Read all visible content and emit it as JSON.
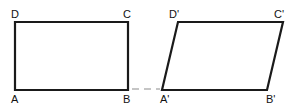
{
  "figure": {
    "background_color": "#ffffff",
    "stroke_color": "#1a1a1a",
    "stroke_width": 2.2,
    "connector_color": "#b3b3b3",
    "shapes": [
      {
        "id": "rectangle-abcd",
        "name": "rectangle-abcd",
        "kind": "rectangle",
        "points": "15,22 128,22 128,90 15,90",
        "vertices": [
          {
            "key": "A",
            "label": "A",
            "x": 15,
            "y": 90
          },
          {
            "key": "B",
            "label": "B",
            "x": 128,
            "y": 90
          },
          {
            "key": "C",
            "label": "C",
            "x": 128,
            "y": 22
          },
          {
            "key": "D",
            "label": "D",
            "x": 15,
            "y": 22
          }
        ]
      },
      {
        "id": "parallelogram-abcd-prime",
        "name": "parallelogram-abcd-prime",
        "kind": "parallelogram",
        "points": "178,22 283,22 267,90 162,90",
        "shear_offset_px": 16,
        "vertices": [
          {
            "key": "Ap",
            "label": "A'",
            "x": 162,
            "y": 90
          },
          {
            "key": "Bp",
            "label": "B'",
            "x": 267,
            "y": 90
          },
          {
            "key": "Cp",
            "label": "C'",
            "x": 283,
            "y": 22
          },
          {
            "key": "Dp",
            "label": "D'",
            "x": 178,
            "y": 22
          }
        ]
      }
    ],
    "connector": {
      "name": "baseline-dashed-connector",
      "x1": 132,
      "y1": 89,
      "x2": 160,
      "y2": 89,
      "dash": "7 5"
    }
  }
}
